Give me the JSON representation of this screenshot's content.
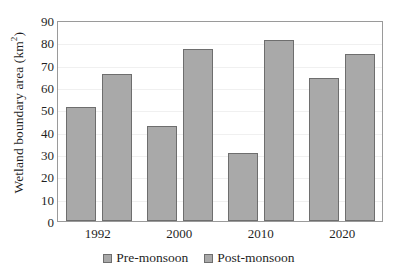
{
  "chart_data": {
    "type": "bar",
    "title": "",
    "xlabel": "",
    "ylabel": "Wetland boundary area (km2)",
    "ylabel_base": "Wetland boundary area (km",
    "ylabel_sup": "2",
    "ylabel_tail": ")",
    "categories": [
      "1992",
      "2000",
      "2010",
      "2020"
    ],
    "series": [
      {
        "name": "Pre-monsoon",
        "values": [
          51,
          42.5,
          30.5,
          64
        ]
      },
      {
        "name": "Post-monsoon",
        "values": [
          66,
          77,
          81,
          75
        ]
      }
    ],
    "ylim": [
      0,
      90
    ],
    "ytick_values": [
      90,
      80,
      70,
      60,
      50,
      40,
      30,
      20,
      10,
      0
    ],
    "yticks": [
      "90",
      "80",
      "70",
      "60",
      "50",
      "40",
      "30",
      "20",
      "10",
      "0"
    ],
    "grid": true,
    "grid_axis": "y",
    "legend_position": "bottom",
    "colors": {
      "bar_fill": "#a9a9a9",
      "bar_border": "#6e6e6e",
      "axis_border": "#9a9a9a",
      "gridline": "#f0f0f0",
      "text": "#1f1f1f",
      "background": "#ffffff"
    }
  }
}
